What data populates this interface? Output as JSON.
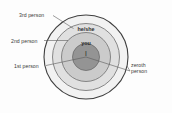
{
  "figure": {
    "colors": {
      "background": "#fdfdfd",
      "ring_outer": "#e3e3e3",
      "ring_middle": "#cfcfcf",
      "ring_inner": "#b4b4b4",
      "core": "#8f8f8f",
      "stroke": "#4a4a4a",
      "leader": "#5a5a5a",
      "text": "#3b3b3b"
    },
    "outer_labels": [
      {
        "id": "third",
        "text": "3rd person"
      },
      {
        "id": "second",
        "text": "2nd person"
      },
      {
        "id": "first",
        "text": "1st person"
      },
      {
        "id": "zeroth",
        "line1": "zeroth",
        "line2": "person"
      }
    ],
    "ring_labels": [
      {
        "id": "heshe",
        "text": "he/she"
      },
      {
        "id": "you",
        "text": "you"
      },
      {
        "id": "i",
        "text": "I"
      }
    ]
  }
}
